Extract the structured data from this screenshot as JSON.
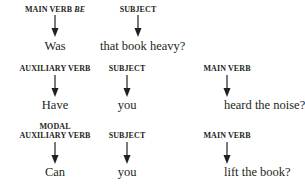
{
  "rows": [
    {
      "columns": [
        {
          "label": "MAIN VERB",
          "label_italic": "BE",
          "word": "Was"
        },
        {
          "label": "SUBJECT",
          "word": "that book heavy?"
        }
      ]
    },
    {
      "columns": [
        {
          "label": "AUXILIARY VERB",
          "word": "Have"
        },
        {
          "label": "SUBJECT",
          "word": "you"
        },
        {
          "label": "MAIN VERB",
          "word": "heard the noise?"
        }
      ]
    },
    {
      "columns": [
        {
          "label_line1": "MODAL",
          "label": "AUXILIARY VERB",
          "word": "Can"
        },
        {
          "label": "SUBJECT",
          "word": "you"
        },
        {
          "label": "MAIN VERB",
          "word": "lift the book?"
        }
      ]
    }
  ],
  "colors": {
    "text": "#231f20",
    "arrow": "#231f20",
    "background": "#ffffff"
  },
  "icons": {
    "arrow": "arrow-down-icon"
  }
}
